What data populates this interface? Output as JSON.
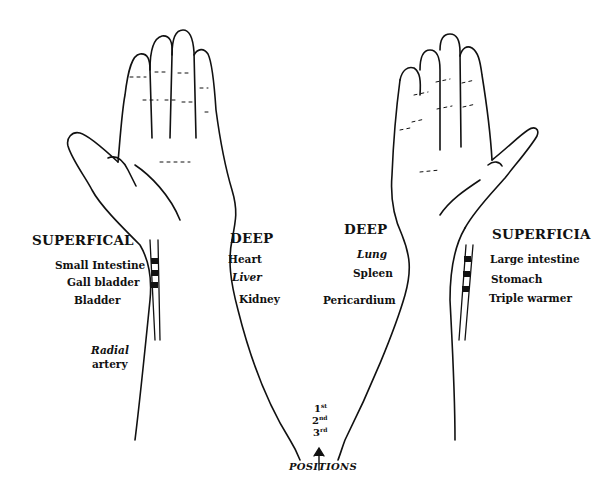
{
  "diagram": {
    "left_hand": {
      "superficial": {
        "heading": "SUPERFICAL",
        "organs": [
          "Small Intestine",
          "Gall bladder",
          "Bladder"
        ]
      },
      "deep": {
        "heading": "DEEP",
        "organs": [
          "Heart",
          "Liver",
          "Kidney"
        ]
      },
      "artery_label_line1": "Radial",
      "artery_label_line2": "artery"
    },
    "right_hand": {
      "deep": {
        "heading": "DEEP",
        "organs": [
          "Lung",
          "Spleen",
          "Pericardium"
        ]
      },
      "superficial": {
        "heading": "SUPERFICIA",
        "organs": [
          "Large intestine",
          "Stomach",
          "Triple warmer"
        ]
      }
    },
    "positions": {
      "items": [
        {
          "num": "1",
          "suffix": "st"
        },
        {
          "num": "2",
          "suffix": "nd"
        },
        {
          "num": "3",
          "suffix": "rd"
        }
      ],
      "label": "POSITIONS"
    },
    "colors": {
      "line": "#111111",
      "background": "#ffffff"
    }
  }
}
